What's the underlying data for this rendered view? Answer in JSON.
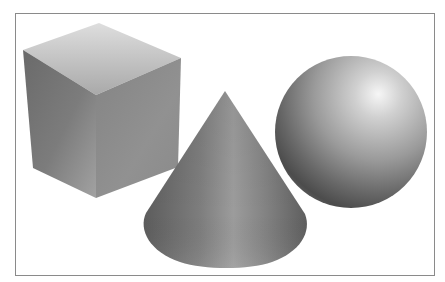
{
  "figure": {
    "shapes": [
      {
        "type": "cube",
        "label": "cube"
      },
      {
        "type": "cone",
        "label": "cone"
      },
      {
        "type": "sphere",
        "label": "sphere"
      }
    ],
    "colors": {
      "background": "#ffffff",
      "frame": "#8a8a8a",
      "cube_top_light": "#dcdcdc",
      "cube_top_dark": "#a8a8a8",
      "cube_left_dark": "#5e5e5e",
      "cube_left_light": "#9a9a9a",
      "cube_right": "#8c8c8c",
      "cone_dark": "#5a5a5a",
      "cone_mid": "#9a9a9a",
      "sphere_highlight": "#f4f4f4",
      "sphere_mid": "#9c9c9c",
      "sphere_dark": "#4a4a4a"
    }
  }
}
